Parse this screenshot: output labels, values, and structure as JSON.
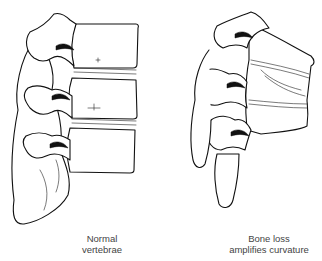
{
  "figure": {
    "panels": [
      {
        "id": "normal",
        "caption_line1": "Normal",
        "caption_line2": "vertebrae",
        "vertebra_count": 3
      },
      {
        "id": "bone-loss",
        "caption_line1": "Bone loss",
        "caption_line2": "amplifies curvature",
        "vertebra_count": 3
      }
    ]
  },
  "colors": {
    "line": "#111111",
    "caption": "#444444",
    "background": "#ffffff"
  }
}
